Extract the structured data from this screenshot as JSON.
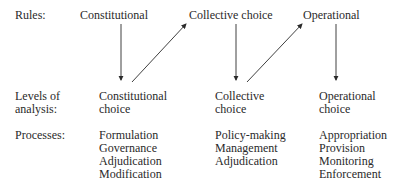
{
  "row_labels": {
    "rules": "Rules:",
    "levels_line1": "Levels of",
    "levels_line2": "analysis:",
    "processes": "Processes:"
  },
  "rules": [
    "Constitutional",
    "Collective choice",
    "Operational"
  ],
  "levels": [
    {
      "line1": "Constitutional",
      "line2": "choice"
    },
    {
      "line1": "Collective",
      "line2": "choice"
    },
    {
      "line1": "Operational",
      "line2": "choice"
    }
  ],
  "processes": [
    [
      "Formulation",
      "Governance",
      "Adjudication",
      "Modification"
    ],
    [
      "Policy-making",
      "Management",
      "Adjudication"
    ],
    [
      "Appropriation",
      "Provision",
      "Monitoring",
      "Enforcement"
    ]
  ]
}
